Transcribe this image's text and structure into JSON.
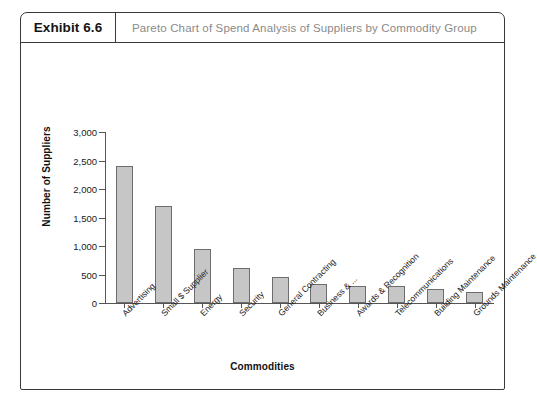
{
  "exhibit": {
    "number_label": "Exhibit 6.6",
    "title": "Pareto Chart of Spend Analysis of Suppliers by Commodity Group"
  },
  "chart_data": {
    "type": "bar",
    "title": "Pareto Chart of Spend Analysis of Suppliers by Commodity Group",
    "xlabel": "Commodities",
    "ylabel": "Number of Suppliers",
    "categories": [
      "Advertising",
      "Small $ Supplier",
      "Energy",
      "Security",
      "General Contracting",
      "Business & ...",
      "Awards & Recognition",
      "Telecommunications",
      "Building Maintenance",
      "Grounds Maintenance"
    ],
    "values": [
      2400,
      1700,
      940,
      610,
      450,
      330,
      290,
      300,
      250,
      200
    ],
    "ylim": [
      0,
      3000
    ],
    "yticks": [
      0,
      500,
      1000,
      1500,
      2000,
      2500,
      3000
    ],
    "ytick_labels": [
      "0",
      "500",
      "1,000",
      "1,500",
      "2,000",
      "2,500",
      "3,000"
    ],
    "grid": false,
    "legend": "none",
    "bar_color": "#c6c6c6",
    "bar_edge_color": "#6d6d6d"
  },
  "colors": {
    "frame": "#3a3a3a",
    "title_gray": "#8a8a8a",
    "axis": "#555555",
    "text": "#1a1a1a"
  }
}
